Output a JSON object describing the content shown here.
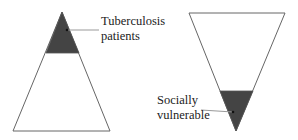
{
  "diagram": {
    "left_pyramid": {
      "label_line1": "Tuberculosis",
      "label_line2": "patients",
      "fill_color": "#444444",
      "outline_color": "#555555"
    },
    "right_pyramid": {
      "label_line1": "Socially",
      "label_line2": "vulnerable",
      "fill_color": "#444444",
      "outline_color": "#555555"
    }
  }
}
